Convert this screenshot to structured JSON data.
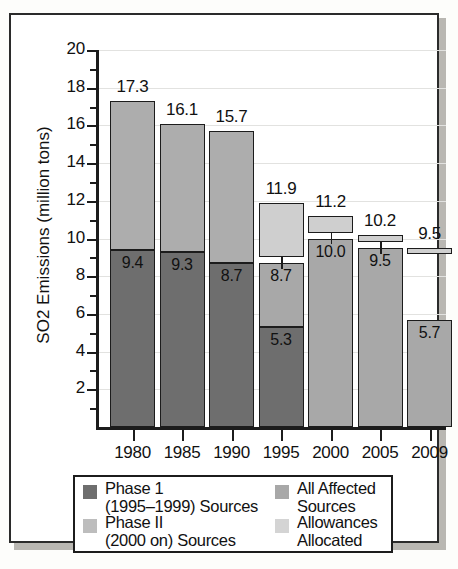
{
  "chart_data": {
    "type": "bar",
    "title": "",
    "xlabel": "",
    "ylabel": "SO2 Emissions (million tons)",
    "ylim": [
      0,
      20
    ],
    "ytick_values": [
      2,
      4,
      6,
      8,
      10,
      12,
      14,
      16,
      18,
      20
    ],
    "ytick_labels": [
      "2",
      "4",
      "6",
      "8",
      "10",
      "12",
      "14",
      "16",
      "18",
      "20"
    ],
    "grid": true,
    "legend_position": "below-axes",
    "categories": [
      "1980",
      "1985",
      "1990",
      "1995",
      "2000",
      "2005",
      "2009"
    ],
    "totals": [
      17.3,
      16.1,
      15.7,
      11.9,
      11.2,
      10.2,
      9.5
    ],
    "total_labels": [
      "17.3",
      "16.1",
      "15.7",
      "11.9",
      "11.2",
      "10.2",
      "9.5"
    ],
    "inner_labels": [
      "9.4",
      "9.3",
      "8.7",
      "8.7",
      "10.0",
      "9.5",
      "5.7"
    ],
    "series": [
      {
        "name": "Phase 1 (1995-1999) Sources",
        "color": "#6e6e6e",
        "values": [
          9.4,
          9.3,
          8.7,
          5.3,
          null,
          null,
          null
        ]
      },
      {
        "name": "Phase II (2000 on) Sources",
        "color": "#adadad",
        "values": [
          7.9,
          6.8,
          7.0,
          3.4,
          null,
          null,
          null
        ]
      },
      {
        "name": "All Affected Sources",
        "color": "#a8a8a8",
        "values": [
          null,
          null,
          null,
          null,
          10.0,
          9.5,
          5.7
        ]
      },
      {
        "name": "Allowances Allocated",
        "color": "#cfcfcf",
        "values": [
          null,
          null,
          null,
          11.9,
          11.2,
          10.2,
          9.5
        ]
      }
    ],
    "bars": [
      {
        "category": "1980",
        "total": 17.3,
        "total_label": "17.3",
        "segments": [
          {
            "series": "Phase 1 (1995-1999) Sources",
            "from": 0,
            "to": 9.4,
            "label": "9.4"
          },
          {
            "series": "Phase II (2000 on) Sources",
            "from": 9.4,
            "to": 17.3,
            "label": ""
          }
        ]
      },
      {
        "category": "1985",
        "total": 16.1,
        "total_label": "16.1",
        "segments": [
          {
            "series": "Phase 1 (1995-1999) Sources",
            "from": 0,
            "to": 9.3,
            "label": "9.3"
          },
          {
            "series": "Phase II (2000 on) Sources",
            "from": 9.3,
            "to": 16.1,
            "label": ""
          }
        ]
      },
      {
        "category": "1990",
        "total": 15.7,
        "total_label": "15.7",
        "segments": [
          {
            "series": "Phase 1 (1995-1999) Sources",
            "from": 0,
            "to": 8.7,
            "label": "8.7"
          },
          {
            "series": "Phase II (2000 on) Sources",
            "from": 8.7,
            "to": 15.7,
            "label": ""
          }
        ]
      },
      {
        "category": "1995",
        "total": 11.9,
        "total_label": "11.9",
        "segments": [
          {
            "series": "Phase 1 (1995-1999) Sources",
            "from": 0,
            "to": 5.3,
            "label": "5.3"
          },
          {
            "series": "All Affected Sources",
            "from": 5.3,
            "to": 8.7,
            "label": "8.7"
          },
          {
            "series": "Allowances Allocated",
            "from": 9.0,
            "to": 11.9,
            "label": ""
          }
        ]
      },
      {
        "category": "2000",
        "total": 11.2,
        "total_label": "11.2",
        "segments": [
          {
            "series": "All Affected Sources",
            "from": 0,
            "to": 10.0,
            "label": "10.0"
          },
          {
            "series": "Allowances Allocated",
            "from": 10.3,
            "to": 11.2,
            "label": ""
          }
        ]
      },
      {
        "category": "2005",
        "total": 10.2,
        "total_label": "10.2",
        "segments": [
          {
            "series": "All Affected Sources",
            "from": 0,
            "to": 9.5,
            "label": "9.5"
          },
          {
            "series": "Allowances Allocated",
            "from": 9.8,
            "to": 10.2,
            "label": ""
          }
        ]
      },
      {
        "category": "2009",
        "total": 9.5,
        "total_label": "9.5",
        "segments": [
          {
            "series": "All Affected Sources",
            "from": 0,
            "to": 5.7,
            "label": "5.7"
          },
          {
            "series": "Allowances Allocated",
            "from": 9.2,
            "to": 9.5,
            "label": ""
          }
        ]
      }
    ],
    "legend": {
      "entries": [
        {
          "label_line1": "Phase 1",
          "label_line2": "(1995–1999) Sources",
          "color": "#6e6e6e",
          "column": "left"
        },
        {
          "label_line1": "Phase II",
          "label_line2": "(2000 on) Sources",
          "color": "#bdbdbd",
          "column": "left"
        },
        {
          "label_line1": "All Affected",
          "label_line2": "Sources",
          "color": "#a8a8a8",
          "column": "right"
        },
        {
          "label_line1": "Allowances",
          "label_line2": "Allocated",
          "color": "#d4d4d4",
          "column": "right"
        }
      ]
    }
  }
}
